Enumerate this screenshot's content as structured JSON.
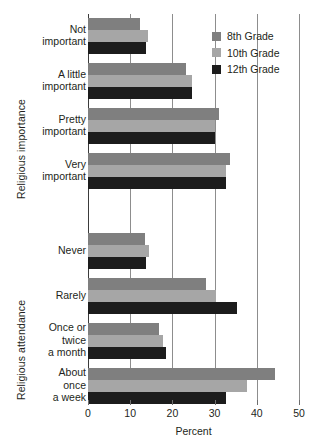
{
  "chart_data": {
    "type": "bar",
    "orientation": "horizontal",
    "title": "",
    "xlabel": "Percent",
    "ylabel": "",
    "xlim": [
      0,
      50
    ],
    "xticks": [
      0,
      10,
      20,
      30,
      40,
      50
    ],
    "xtick_labels": [
      "0",
      "10",
      "20",
      "30",
      "40",
      "50"
    ],
    "grid": "vertical gridlines at each x tick",
    "legend_position": "top-right inside plot",
    "axis_groups": [
      {
        "name": "Religious importance",
        "categories": [
          "Not important",
          "A little important",
          "Pretty important",
          "Very important"
        ]
      },
      {
        "name": "Religious attendance",
        "categories": [
          "Never",
          "Rarely",
          "Once or twice a month",
          "About once a week"
        ]
      }
    ],
    "categories": [
      "Not important",
      "A little important",
      "Pretty important",
      "Very important",
      "Never",
      "Rarely",
      "Once or twice a month",
      "About once a week"
    ],
    "category_lines": [
      [
        "Not",
        "important"
      ],
      [
        "A little",
        "important"
      ],
      [
        "Pretty",
        "important"
      ],
      [
        "Very",
        "important"
      ],
      [
        "Never"
      ],
      [
        "Rarely"
      ],
      [
        "Once or",
        "twice",
        "a month"
      ],
      [
        "About",
        "once",
        "a week"
      ]
    ],
    "series": [
      {
        "name": "8th Grade",
        "color": "#7f7f7f",
        "values": [
          12.3,
          23.3,
          31.1,
          33.6,
          13.5,
          28.0,
          16.8,
          44.3
        ]
      },
      {
        "name": "10th Grade",
        "color": "#a6a6a6",
        "values": [
          14.3,
          24.7,
          30.1,
          32.6,
          14.5,
          30.3,
          17.8,
          37.6
        ]
      },
      {
        "name": "12th Grade",
        "color": "#1c1c1c",
        "values": [
          13.8,
          24.6,
          30.1,
          32.7,
          13.7,
          35.2,
          18.6,
          32.7
        ]
      }
    ]
  },
  "legend": {
    "entries": [
      {
        "label": "8th Grade",
        "color": "#7f7f7f"
      },
      {
        "label": "10th Grade",
        "color": "#a6a6a6"
      },
      {
        "label": "12th Grade",
        "color": "#1c1c1c"
      }
    ]
  },
  "axis": {
    "x_title": "Percent",
    "group_label_importance": "Religious importance",
    "group_label_attendance": "Religious attendance"
  },
  "colors": {
    "grade8": "#7f7f7f",
    "grade10": "#a6a6a6",
    "grade12": "#1c1c1c",
    "gridline": "#8d8d8d",
    "axis": "#3b3b3b",
    "text": "#231f20",
    "background": "#ffffff"
  }
}
